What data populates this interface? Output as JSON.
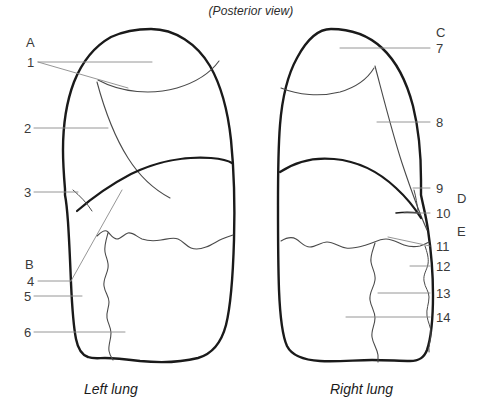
{
  "figure": {
    "title": "(Posterior view)",
    "captions": {
      "left": "Left lung",
      "right": "Right lung"
    },
    "colors": {
      "outline": "#1a1a1a",
      "fissure": "#4a4a4a",
      "leader": "#8a8a8a",
      "text": "#3a3a3a",
      "background": "#ffffff"
    }
  },
  "labels": {
    "left_column": [
      {
        "id": "A",
        "text": "A",
        "kind": "letter"
      },
      {
        "id": "1",
        "text": "1",
        "kind": "number"
      },
      {
        "id": "2",
        "text": "2",
        "kind": "number"
      },
      {
        "id": "3",
        "text": "3",
        "kind": "number"
      },
      {
        "id": "B",
        "text": "B",
        "kind": "letter"
      },
      {
        "id": "4",
        "text": "4",
        "kind": "number"
      },
      {
        "id": "5",
        "text": "5",
        "kind": "number"
      },
      {
        "id": "6",
        "text": "6",
        "kind": "number"
      }
    ],
    "right_column": [
      {
        "id": "C",
        "text": "C",
        "kind": "letter"
      },
      {
        "id": "7",
        "text": "7",
        "kind": "number"
      },
      {
        "id": "8",
        "text": "8",
        "kind": "number"
      },
      {
        "id": "9",
        "text": "9",
        "kind": "number"
      },
      {
        "id": "D",
        "text": "D",
        "kind": "letter"
      },
      {
        "id": "10",
        "text": "10",
        "kind": "number"
      },
      {
        "id": "E",
        "text": "E",
        "kind": "letter"
      },
      {
        "id": "11",
        "text": "11",
        "kind": "number"
      },
      {
        "id": "12",
        "text": "12",
        "kind": "number"
      },
      {
        "id": "13",
        "text": "13",
        "kind": "number"
      },
      {
        "id": "14",
        "text": "14",
        "kind": "number"
      }
    ]
  }
}
